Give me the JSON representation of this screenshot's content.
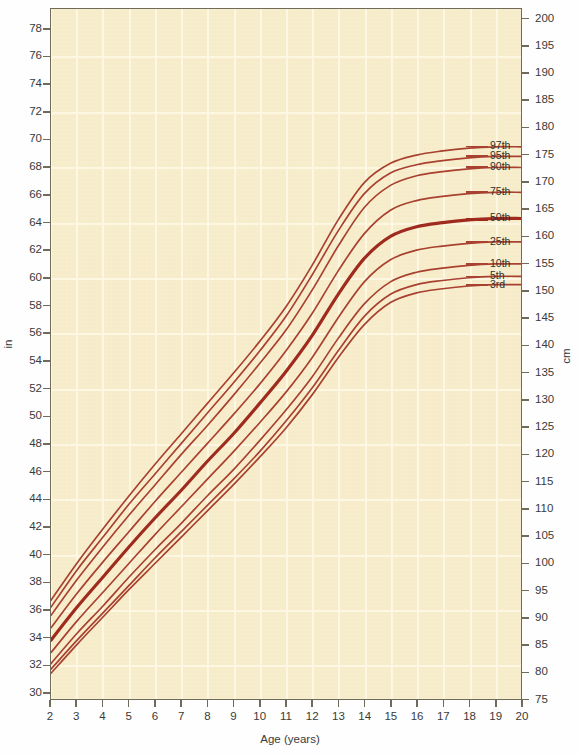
{
  "chart_data": {
    "type": "line",
    "title": "",
    "subtitle": "",
    "xlabel": "Age (years)",
    "ylabel": "in",
    "ylabel_right": "cm",
    "xlim": [
      2,
      20
    ],
    "ylim": [
      29.5,
      79.5
    ],
    "ylim_right": [
      74.93,
      201.93
    ],
    "grid": true,
    "legend_position": "right-inline-labels",
    "x_ticks": [
      2,
      3,
      4,
      5,
      6,
      7,
      8,
      9,
      10,
      11,
      12,
      13,
      14,
      15,
      16,
      17,
      18,
      19,
      20
    ],
    "y_ticks_in": [
      30,
      32,
      34,
      36,
      38,
      40,
      42,
      44,
      46,
      48,
      50,
      52,
      54,
      56,
      58,
      60,
      62,
      64,
      66,
      68,
      70,
      72,
      74,
      76,
      78
    ],
    "y_ticks_cm": [
      75,
      80,
      85,
      90,
      95,
      100,
      105,
      110,
      115,
      120,
      125,
      130,
      135,
      140,
      145,
      150,
      155,
      160,
      165,
      170,
      175,
      180,
      185,
      190,
      195,
      200
    ],
    "line_color": "#a8412f",
    "line_color_emphasis": "#9e2b1e",
    "background_color": "#f7ecc9",
    "gridline_color": "#fdf8e4",
    "border_color": "#6f6a5a",
    "x": [
      2,
      3,
      4,
      5,
      6,
      7,
      8,
      9,
      10,
      11,
      12,
      13,
      14,
      15,
      16,
      17,
      18,
      19,
      20
    ],
    "series": [
      {
        "name": "97th",
        "label": "97th",
        "emphasis": false,
        "values": [
          36.6,
          39.3,
          41.8,
          44.2,
          46.5,
          48.7,
          50.9,
          53.1,
          55.4,
          57.9,
          60.9,
          64.2,
          66.9,
          68.3,
          68.9,
          69.2,
          69.4,
          69.5,
          69.5
        ]
      },
      {
        "name": "95th",
        "label": "95th",
        "emphasis": false,
        "values": [
          36.1,
          38.8,
          41.2,
          43.6,
          45.8,
          48.0,
          50.2,
          52.4,
          54.7,
          57.2,
          60.2,
          63.4,
          66.1,
          67.6,
          68.2,
          68.5,
          68.7,
          68.8,
          68.8
        ]
      },
      {
        "name": "90th",
        "label": "90th",
        "emphasis": false,
        "values": [
          35.5,
          38.1,
          40.5,
          42.8,
          45.0,
          47.2,
          49.3,
          51.5,
          53.8,
          56.2,
          59.1,
          62.3,
          65.1,
          66.7,
          67.4,
          67.7,
          67.9,
          68.0,
          68.0
        ]
      },
      {
        "name": "75th",
        "label": "75th",
        "emphasis": false,
        "values": [
          34.6,
          37.1,
          39.4,
          41.6,
          43.8,
          45.9,
          48.0,
          50.1,
          52.3,
          54.7,
          57.4,
          60.5,
          63.2,
          64.9,
          65.6,
          65.9,
          66.1,
          66.2,
          66.2
        ]
      },
      {
        "name": "50th",
        "label": "50th",
        "emphasis": true,
        "values": [
          33.7,
          36.1,
          38.3,
          40.5,
          42.6,
          44.6,
          46.7,
          48.7,
          50.9,
          53.2,
          55.8,
          58.8,
          61.4,
          63.0,
          63.7,
          64.0,
          64.2,
          64.3,
          64.3
        ]
      },
      {
        "name": "25th",
        "label": "25th",
        "emphasis": false,
        "values": [
          32.8,
          35.1,
          37.2,
          39.3,
          41.4,
          43.4,
          45.4,
          47.4,
          49.5,
          51.7,
          54.2,
          57.1,
          59.7,
          61.3,
          62.0,
          62.3,
          62.5,
          62.6,
          62.6
        ]
      },
      {
        "name": "10th",
        "label": "10th",
        "emphasis": false,
        "values": [
          32.0,
          34.2,
          36.2,
          38.3,
          40.3,
          42.2,
          44.2,
          46.1,
          48.2,
          50.4,
          52.8,
          55.6,
          58.1,
          59.7,
          60.4,
          60.7,
          60.9,
          61.0,
          61.0
        ]
      },
      {
        "name": "5th",
        "label": "5th",
        "emphasis": false,
        "values": [
          31.6,
          33.7,
          35.7,
          37.7,
          39.7,
          41.6,
          43.5,
          45.4,
          47.4,
          49.6,
          52.0,
          54.7,
          57.2,
          58.8,
          59.5,
          59.8,
          60.0,
          60.1,
          60.1
        ]
      },
      {
        "name": "3rd",
        "label": "3rd",
        "emphasis": false,
        "values": [
          31.3,
          33.4,
          35.4,
          37.4,
          39.3,
          41.2,
          43.1,
          45.0,
          47.0,
          49.1,
          51.5,
          54.2,
          56.6,
          58.2,
          58.9,
          59.2,
          59.4,
          59.5,
          59.5
        ]
      }
    ]
  }
}
